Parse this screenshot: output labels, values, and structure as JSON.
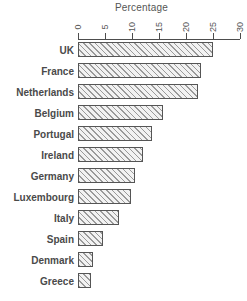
{
  "chart_data": {
    "type": "bar",
    "orientation": "horizontal",
    "title": "",
    "xlabel": "Percentage",
    "ylabel": "",
    "xlim": [
      0,
      30
    ],
    "xticks": [
      0,
      5,
      10,
      15,
      20,
      25,
      30
    ],
    "xtick_labels": [
      "0",
      "5",
      "10",
      "15",
      "20",
      "25",
      "30"
    ],
    "grid": false,
    "legend": null,
    "categories": [
      "UK",
      "France",
      "Netherlands",
      "Belgium",
      "Portugal",
      "Ireland",
      "Germany",
      "Luxembourg",
      "Italy",
      "Spain",
      "Denmark",
      "Greece"
    ],
    "values": [
      25.0,
      22.7,
      22.3,
      15.7,
      13.7,
      12.0,
      10.5,
      9.8,
      7.5,
      4.6,
      2.8,
      2.4
    ],
    "series": [
      {
        "name": "Percentage",
        "values": [
          25.0,
          22.7,
          22.3,
          15.7,
          13.7,
          12.0,
          10.5,
          9.8,
          7.5,
          4.6,
          2.8,
          2.4
        ]
      }
    ],
    "style": {
      "bar_fill": "#f2f2f2",
      "bar_hatch": "diagonal-forward",
      "bar_edge_color": "#555555",
      "axis_color": "#4d4d4d",
      "text_color": "#4d4d4d",
      "background": "#ffffff"
    }
  }
}
